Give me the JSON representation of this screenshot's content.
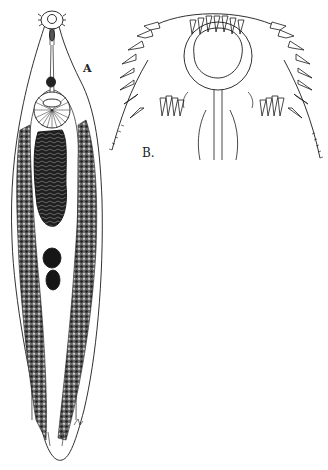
{
  "figure": {
    "type": "biological illustration",
    "panels": [
      {
        "id": "A",
        "label": "A",
        "description": "Whole body, ventral view"
      },
      {
        "id": "B",
        "label": "B.",
        "description": "Enlarged anterior end showing crown of spines around oral sucker"
      }
    ],
    "colors": {
      "ink": "#1a1a1a",
      "background": "#ffffff",
      "stipple": "#3a3a3a"
    }
  }
}
